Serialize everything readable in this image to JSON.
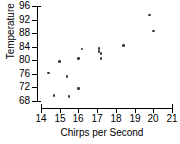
{
  "chart_data": {
    "type": "scatter",
    "title": "",
    "xlabel": "Chirps per Second",
    "ylabel": "Temperature (°F)",
    "ylabel_text": "Temperature",
    "ylabel_unit": "°F",
    "xlim": [
      14,
      21
    ],
    "ylim": [
      68,
      96
    ],
    "grid": false,
    "legend": null,
    "xticks": [
      14,
      15,
      16,
      17,
      18,
      19,
      20,
      21
    ],
    "yticks": [
      68,
      72,
      76,
      80,
      84,
      88,
      92,
      96
    ],
    "marker_color": "#3a3a3a",
    "axis_color": "#000000",
    "x": [
      14.4,
      14.7,
      15.0,
      15.4,
      15.5,
      16.0,
      16.0,
      16.2,
      17.1,
      17.1,
      17.2,
      17.2,
      18.4,
      19.8,
      20.0
    ],
    "y": [
      76.3,
      69.7,
      79.6,
      75.2,
      69.4,
      71.6,
      80.6,
      83.3,
      83.5,
      82.6,
      82.0,
      80.6,
      84.3,
      93.3,
      88.6
    ],
    "points": [
      {
        "x": 14.4,
        "y": 76.3
      },
      {
        "x": 14.7,
        "y": 69.7
      },
      {
        "x": 15.0,
        "y": 79.6
      },
      {
        "x": 15.4,
        "y": 75.2
      },
      {
        "x": 15.5,
        "y": 69.4
      },
      {
        "x": 16.0,
        "y": 71.6
      },
      {
        "x": 16.0,
        "y": 80.6
      },
      {
        "x": 16.2,
        "y": 83.3
      },
      {
        "x": 17.1,
        "y": 83.5
      },
      {
        "x": 17.1,
        "y": 82.6
      },
      {
        "x": 17.2,
        "y": 82.0
      },
      {
        "x": 17.2,
        "y": 80.6
      },
      {
        "x": 18.4,
        "y": 84.3
      },
      {
        "x": 19.8,
        "y": 93.3
      },
      {
        "x": 20.0,
        "y": 88.6
      }
    ]
  }
}
